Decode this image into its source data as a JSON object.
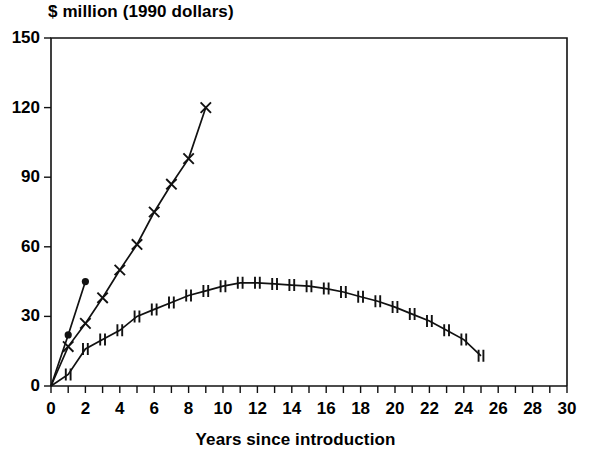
{
  "chart_data": {
    "type": "line",
    "title": "",
    "ylabel": "$ million (1990 dollars)",
    "xlabel": "Years since introduction",
    "xlim": [
      0,
      30
    ],
    "ylim": [
      0,
      150
    ],
    "xticks": [
      0,
      1,
      2,
      3,
      4,
      5,
      6,
      7,
      8,
      9,
      10,
      11,
      12,
      13,
      14,
      15,
      16,
      17,
      18,
      19,
      20,
      21,
      22,
      23,
      24,
      25,
      26,
      27,
      28,
      29,
      30
    ],
    "xtick_labels": [
      "0",
      "",
      "2",
      "",
      "4",
      "",
      "6",
      "",
      "8",
      "",
      "10",
      "",
      "12",
      "",
      "14",
      "",
      "16",
      "",
      "18",
      "",
      "20",
      "",
      "22",
      "",
      "24",
      "",
      "26",
      "",
      "28",
      "",
      "30"
    ],
    "yticks": [
      0,
      30,
      60,
      90,
      120,
      150
    ],
    "ytick_labels": [
      "0",
      "30",
      "60",
      "90",
      "120",
      "150"
    ],
    "grid": false,
    "legend": "none",
    "frame": "box",
    "series": [
      {
        "name": "steep-dot-series",
        "marker": "filled-circle",
        "x": [
          0,
          1,
          2
        ],
        "values": [
          0,
          22,
          45
        ]
      },
      {
        "name": "rising-cross-series",
        "marker": "x-cross",
        "x": [
          0,
          1,
          2,
          3,
          4,
          5,
          6,
          7,
          8,
          9
        ],
        "values": [
          0,
          17,
          27,
          38,
          50,
          61,
          75,
          87,
          98,
          120
        ]
      },
      {
        "name": "peaked-double-tick-series",
        "marker": "double-tick",
        "x": [
          0,
          1,
          2,
          3,
          4,
          5,
          6,
          7,
          8,
          9,
          10,
          11,
          12,
          13,
          14,
          15,
          16,
          17,
          18,
          19,
          20,
          21,
          22,
          23,
          24,
          25
        ],
        "values": [
          0,
          5,
          16,
          20,
          24,
          30,
          33,
          36,
          39,
          41,
          43,
          44.5,
          44.5,
          44,
          43.5,
          43,
          42,
          40.5,
          38.5,
          36.5,
          34,
          31,
          28,
          24,
          20,
          13
        ]
      }
    ]
  },
  "axis_titles": {
    "y": "$ million (1990 dollars)",
    "x": "Years since introduction"
  }
}
